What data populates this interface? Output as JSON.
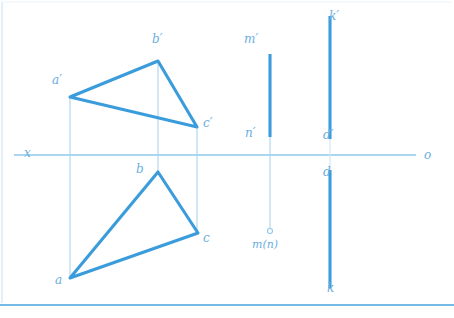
{
  "drawing": {
    "title": "Descriptive geometry orthographic projection",
    "colors": {
      "thick_line": "#3b9cdc",
      "thin_line": "#a9d5ef",
      "axis": "#8fc8ea",
      "label": "#6aaede",
      "border": "#4aa3e0",
      "background": "#ffffff"
    },
    "axis": {
      "label_left": "x",
      "label_right": "o",
      "y": 155,
      "x_start": 14,
      "x_end": 416
    },
    "upper_triangle": {
      "name": "frontal-projection-triangle",
      "vertices": [
        {
          "label": "a′",
          "x": 70,
          "y": 97,
          "label_x": 52,
          "label_y": 74
        },
        {
          "label": "b′",
          "x": 158,
          "y": 61,
          "label_x": 152,
          "label_y": 33
        },
        {
          "label": "c′",
          "x": 197,
          "y": 127,
          "label_x": 203,
          "label_y": 117
        }
      ]
    },
    "lower_triangle": {
      "name": "horizontal-projection-triangle",
      "vertices": [
        {
          "label": "a",
          "x": 70,
          "y": 278,
          "label_x": 55,
          "label_y": 274
        },
        {
          "label": "b",
          "x": 158,
          "y": 172,
          "label_x": 136,
          "label_y": 163
        },
        {
          "label": "c",
          "x": 198,
          "y": 233,
          "label_x": 203,
          "label_y": 232
        }
      ]
    },
    "connector_lines": [
      {
        "name": "connector-a",
        "x": 70,
        "y1": 97,
        "y2": 278
      },
      {
        "name": "connector-b",
        "x": 158,
        "y1": 61,
        "y2": 172
      },
      {
        "name": "connector-c",
        "x": 197,
        "y1": 127,
        "y2": 233
      }
    ],
    "line_mn": {
      "name": "line-m-n",
      "x": 270,
      "thick_top": 54,
      "thick_bottom": 137,
      "thin_bottom": 228,
      "point_radius": 2.5,
      "labels": [
        {
          "text": "m′",
          "x": 244,
          "y": 33
        },
        {
          "text": "n′",
          "x": 245,
          "y": 127
        },
        {
          "text": "m(n)",
          "x": 252,
          "y": 239
        }
      ]
    },
    "line_kd": {
      "name": "line-k-d",
      "x": 330,
      "upper_top": 16,
      "upper_bottom": 139,
      "lower_top": 170,
      "lower_bottom": 288,
      "labels": [
        {
          "text": "k′",
          "x": 329,
          "y": 10
        },
        {
          "text": "d′",
          "x": 323,
          "y": 129
        },
        {
          "text": "d",
          "x": 323,
          "y": 166
        },
        {
          "text": "k",
          "x": 327,
          "y": 282
        }
      ]
    },
    "frame": {
      "left_x": 2,
      "top_y": 2,
      "bottom_y": 305
    }
  }
}
